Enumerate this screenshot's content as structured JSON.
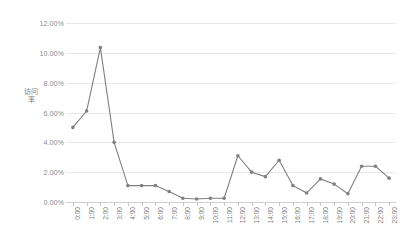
{
  "chart_data": {
    "type": "line",
    "title": "",
    "xlabel": "",
    "ylabel": "访问率",
    "ylim": [
      0,
      12
    ],
    "ytick_format": "percent",
    "grid": true,
    "legend": "none",
    "series_color": "#808080",
    "categories": [
      "0:00",
      "1:00",
      "2:00",
      "3:00",
      "4:00",
      "5:00",
      "6:00",
      "7:00",
      "8:00",
      "9:00",
      "10:00",
      "11:00",
      "12:00",
      "13:00",
      "14:00",
      "15:00",
      "16:00",
      "17:00",
      "18:00",
      "19:00",
      "20:00",
      "21:00",
      "22:00",
      "23:00"
    ],
    "values": [
      5.0,
      6.1,
      10.35,
      4.0,
      1.1,
      1.1,
      1.1,
      0.7,
      0.25,
      0.2,
      0.25,
      0.25,
      3.1,
      2.0,
      1.7,
      2.8,
      1.1,
      0.6,
      1.55,
      1.2,
      0.55,
      2.4,
      2.4,
      1.6
    ],
    "y_ticks": [
      "0.00%",
      "2.00%",
      "4.00%",
      "6.00%",
      "8.00%",
      "10.00%",
      "12.00%"
    ],
    "y_tick_values": [
      0,
      2,
      4,
      6,
      8,
      10,
      12
    ]
  }
}
